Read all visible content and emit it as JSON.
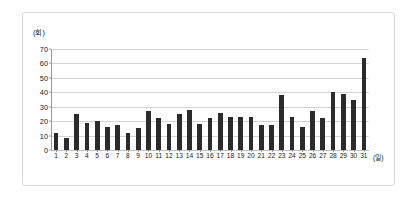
{
  "figure": {
    "background_color": "#ffffff",
    "border_color": "#d8d8d8",
    "bar_color": "#2b2b2b",
    "gridline_color": "#d4d4d4",
    "axis_color": "#9a9a9a"
  },
  "chart_data": {
    "type": "bar",
    "title": "",
    "subtitle": "",
    "xlabel": "(일)",
    "ylabel": "(회)",
    "categories": [
      "1",
      "2",
      "3",
      "4",
      "5",
      "6",
      "7",
      "8",
      "9",
      "10",
      "11",
      "12",
      "13",
      "14",
      "15",
      "16",
      "17",
      "18",
      "19",
      "20",
      "21",
      "22",
      "23",
      "24",
      "25",
      "26",
      "27",
      "28",
      "29",
      "30",
      "31"
    ],
    "values": [
      12,
      8,
      25,
      19,
      20,
      16,
      17,
      12,
      15,
      27,
      22,
      18,
      25,
      28,
      18,
      22,
      26,
      23,
      23,
      23,
      17,
      17,
      38,
      23,
      16,
      27,
      22,
      40,
      39,
      35,
      64
    ],
    "ylim": [
      0,
      70
    ],
    "y_ticks": [
      0,
      10,
      20,
      30,
      40,
      50,
      60,
      70
    ],
    "y_tick_labels": [
      "0",
      "10",
      "20",
      "30",
      "40",
      "50",
      "60",
      "70"
    ],
    "grid": true,
    "grid_axis": "y",
    "legend": false,
    "legend_position": "none",
    "series": [
      {
        "name": "",
        "values": [
          12,
          8,
          25,
          19,
          20,
          16,
          17,
          12,
          15,
          27,
          22,
          18,
          25,
          28,
          18,
          22,
          26,
          23,
          23,
          23,
          17,
          17,
          38,
          23,
          16,
          27,
          22,
          40,
          39,
          35,
          64
        ]
      }
    ]
  }
}
